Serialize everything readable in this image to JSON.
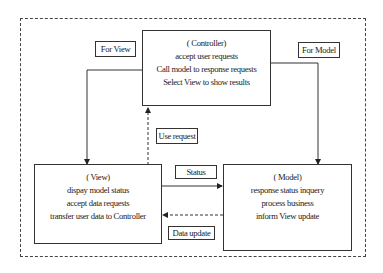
{
  "diagram": {
    "type": "MVC architecture",
    "nodes": {
      "controller": {
        "title": "( Controller)",
        "lines": [
          "accept user requests",
          "Call model to response requests",
          "Select View to show results"
        ]
      },
      "view": {
        "title": "( View)",
        "lines": [
          "dispay model status",
          "accept data requests",
          "transfer user data to Controller"
        ]
      },
      "model": {
        "title": "( Model)",
        "lines": [
          "response status inquery",
          "process business",
          "inform View update"
        ]
      }
    },
    "edges": {
      "for_view": {
        "label": "For View",
        "from": "controller",
        "to": "view",
        "style": "solid"
      },
      "for_model": {
        "label": "For Model",
        "from": "controller",
        "to": "model",
        "style": "solid"
      },
      "use_request": {
        "label": "Use request",
        "from": "view",
        "to": "controller",
        "style": "dashed"
      },
      "status": {
        "label": "Status",
        "from": "view",
        "to": "model",
        "style": "solid"
      },
      "data_update": {
        "label": "Data update",
        "from": "model",
        "to": "view",
        "style": "dashed"
      }
    },
    "colors": {
      "line": "#333333",
      "background": "#ffffff"
    }
  }
}
